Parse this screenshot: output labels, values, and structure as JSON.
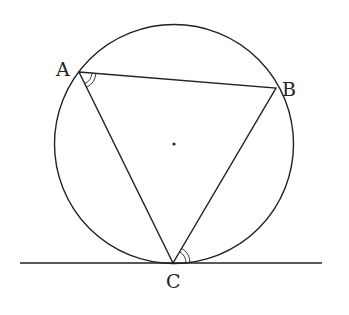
{
  "diagram": {
    "type": "geometry",
    "points": {
      "A": {
        "label": "A",
        "x": 79,
        "y": 72
      },
      "B": {
        "label": "B",
        "x": 276,
        "y": 88
      },
      "C": {
        "label": "C",
        "x": 173,
        "y": 263
      }
    },
    "circle": {
      "cx": 174,
      "cy": 144,
      "r": 119.5
    },
    "center_dot": {
      "x": 174,
      "y": 144
    },
    "tangent_line": {
      "x1": 20,
      "y1": 263,
      "x2": 322,
      "y2": 263
    },
    "angle_marks": [
      {
        "at": "A",
        "between": [
          "AB",
          "AC"
        ],
        "style": "double-arc"
      },
      {
        "at": "C",
        "between": [
          "CB",
          "tangent"
        ],
        "style": "double-arc"
      }
    ],
    "stroke_color": "#222222"
  }
}
